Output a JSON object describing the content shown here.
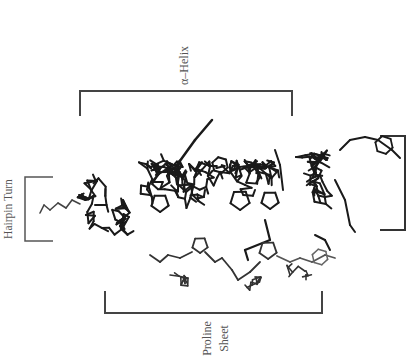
{
  "figure": {
    "labels": {
      "helix": "α–Helix",
      "hairpin": "Hairpin Turn",
      "proline_line1": "Proline",
      "proline_line2": "Sheet"
    },
    "colors": {
      "bond": "#1a1a1a",
      "bond_light": "#555555",
      "bracket": "#444444",
      "text": "#555555"
    }
  }
}
